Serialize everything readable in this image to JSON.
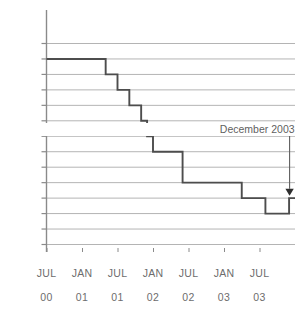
{
  "chart_data": {
    "type": "line",
    "title": "",
    "subtitle": "",
    "xlabel": "",
    "ylabel": "",
    "ylim": [
      3,
      6.4
    ],
    "grid": true,
    "legend_position": "none",
    "step_style": "post",
    "y_ticks": [
      {
        "value": 6.25,
        "label": "6.25"
      },
      {
        "value": 6,
        "label": "6"
      },
      {
        "value": 5.75,
        "label": "5.75"
      },
      {
        "value": 5.5,
        "label": "5.5"
      },
      {
        "value": 5.25,
        "label": "5.25"
      },
      {
        "value": 5,
        "label": "5"
      },
      {
        "value": 4.75,
        "label": "4.75"
      },
      {
        "value": 4.5,
        "label": "4.5"
      },
      {
        "value": 4.25,
        "label": "4.25"
      },
      {
        "value": 4,
        "label": "4"
      },
      {
        "value": 3.75,
        "label": "3.75"
      },
      {
        "value": 3.5,
        "label": "3.5"
      },
      {
        "value": 3.25,
        "label": ""
      },
      {
        "value": 3,
        "label": "3"
      }
    ],
    "x_ticks": [
      {
        "position": 0,
        "month": "JUL",
        "year": "00"
      },
      {
        "position": 6,
        "month": "JAN",
        "year": "01"
      },
      {
        "position": 12,
        "month": "JUL",
        "year": "01"
      },
      {
        "position": 18,
        "month": "JAN",
        "year": "02"
      },
      {
        "position": 24,
        "month": "JUL",
        "year": "02"
      },
      {
        "position": 30,
        "month": "JAN",
        "year": "03"
      },
      {
        "position": 36,
        "month": "JUL",
        "year": "03"
      }
    ],
    "x_range": [
      0,
      42
    ],
    "series": [
      {
        "name": "rate",
        "color": "#4d4d4d",
        "x": [
          0,
          8,
          10,
          12,
          14,
          16,
          17,
          18,
          23,
          31,
          33,
          37,
          41
        ],
        "values": [
          6,
          6,
          5.75,
          5.5,
          5.25,
          5,
          4.75,
          4.5,
          4,
          4,
          3.75,
          3.5,
          3.75
        ]
      }
    ],
    "annotations": [
      {
        "name": "december-2003-callout",
        "text": "December 2003",
        "x": 41,
        "y_target": 3.78,
        "y_label": 4.78,
        "arrow": true,
        "color": "#5f5f5f"
      }
    ],
    "colors": {
      "line": "#4d4d4d",
      "grid": "#b4b4b4",
      "axis": "#8a8a8a",
      "tick_text": "#6d6d6d",
      "annotation": "#5f5f5f",
      "background": "#ffffff"
    }
  }
}
